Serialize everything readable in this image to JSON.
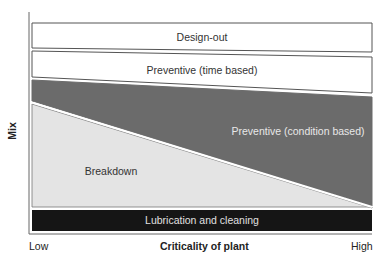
{
  "diagram": {
    "y_axis": {
      "label": "Mix"
    },
    "x_axis": {
      "label": "Criticality of plant",
      "low_label": "Low",
      "high_label": "High"
    },
    "bands": [
      {
        "id": "design-out",
        "label": "Design-out",
        "fill": "#ffffff",
        "text_color": "#333333"
      },
      {
        "id": "preventive-time",
        "label": "Preventive (time based)",
        "fill": "#ffffff",
        "text_color": "#333333"
      },
      {
        "id": "preventive-condition",
        "label": "Preventive (condition based)",
        "fill": "#6b6b6b",
        "text_color": "#e8e8e8"
      },
      {
        "id": "breakdown",
        "label": "Breakdown",
        "fill": "#e4e4e4",
        "text_color": "#333333"
      },
      {
        "id": "lubrication",
        "label": "Lubrication and cleaning",
        "fill": "#151515",
        "text_color": "#e0e0e0"
      }
    ],
    "colors": {
      "outline": "#555555",
      "axis": "#666666",
      "separator": "#ffffff"
    }
  }
}
